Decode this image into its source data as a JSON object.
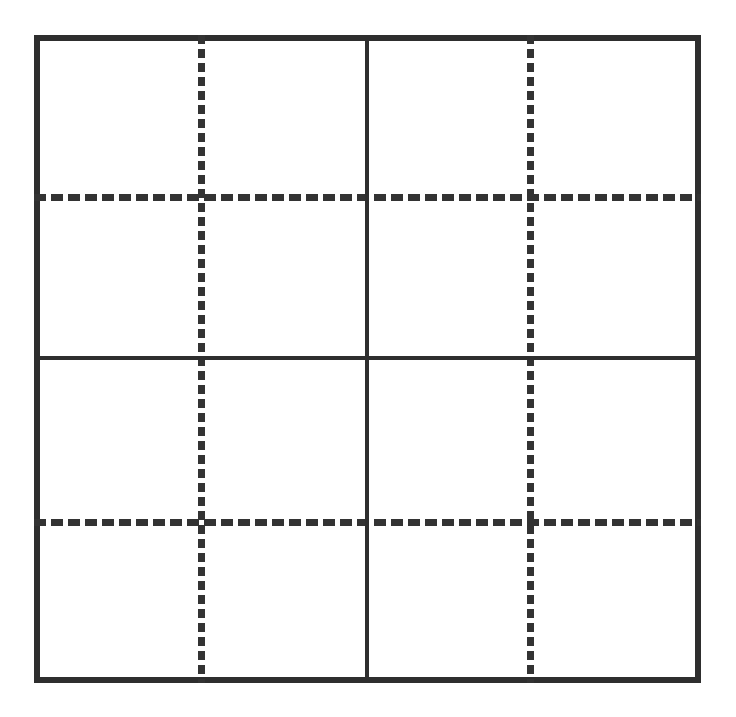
{
  "figure": {
    "background_color": "#ffffff",
    "canvas": {
      "width": 736,
      "height": 717
    }
  },
  "chart_data": {
    "type": "diagram",
    "shape": "square",
    "rows": 4,
    "columns": 4,
    "cell_count": 16,
    "grid": {
      "outer_border": {
        "name": "outer-square",
        "style": "solid",
        "color": "#2e2e2e",
        "thickness_px": 6,
        "left": 34,
        "top": 35,
        "right": 701,
        "bottom": 683,
        "width": 667,
        "height": 648
      },
      "vertical_lines": [
        {
          "name": "dashed-vertical-left",
          "style": "dashed",
          "color": "#333333",
          "x": 201,
          "thickness_px": 7,
          "dash_px": 9,
          "gap_px": 5,
          "spans_full_height": true
        },
        {
          "name": "solid-vertical-center",
          "style": "solid",
          "color": "#2e2e2e",
          "x": 367,
          "thickness_px": 4,
          "spans_full_height": true
        },
        {
          "name": "dashed-vertical-right",
          "style": "dashed",
          "color": "#333333",
          "x": 530,
          "thickness_px": 7,
          "dash_px": 9,
          "gap_px": 5,
          "spans_full_height": true
        }
      ],
      "horizontal_lines": [
        {
          "name": "dashed-horizontal-top",
          "style": "dashed",
          "color": "#333333",
          "y": 197,
          "thickness_px": 7,
          "dash_px": 12,
          "gap_px": 5,
          "spans_full_width": true
        },
        {
          "name": "solid-horizontal-center",
          "style": "solid",
          "color": "#2e2e2e",
          "y": 358,
          "thickness_px": 4,
          "spans_full_width": true
        },
        {
          "name": "dashed-horizontal-bottom",
          "style": "dashed",
          "color": "#333333",
          "y": 522,
          "thickness_px": 7,
          "dash_px": 12,
          "gap_px": 5,
          "spans_full_width": true
        }
      ]
    },
    "quadrants": [
      {
        "name": "top-left",
        "row": 1,
        "column": 1
      },
      {
        "name": "top-right",
        "row": 1,
        "column": 2
      },
      {
        "name": "bottom-left",
        "row": 2,
        "column": 1
      },
      {
        "name": "bottom-right",
        "row": 2,
        "column": 2
      }
    ],
    "cells": [
      {
        "row": 1,
        "column": 1,
        "label": ""
      },
      {
        "row": 1,
        "column": 2,
        "label": ""
      },
      {
        "row": 1,
        "column": 3,
        "label": ""
      },
      {
        "row": 1,
        "column": 4,
        "label": ""
      },
      {
        "row": 2,
        "column": 1,
        "label": ""
      },
      {
        "row": 2,
        "column": 2,
        "label": ""
      },
      {
        "row": 2,
        "column": 3,
        "label": ""
      },
      {
        "row": 2,
        "column": 4,
        "label": ""
      },
      {
        "row": 3,
        "column": 1,
        "label": ""
      },
      {
        "row": 3,
        "column": 2,
        "label": ""
      },
      {
        "row": 3,
        "column": 3,
        "label": ""
      },
      {
        "row": 3,
        "column": 4,
        "label": ""
      },
      {
        "row": 4,
        "column": 1,
        "label": ""
      },
      {
        "row": 4,
        "column": 2,
        "label": ""
      },
      {
        "row": 4,
        "column": 3,
        "label": ""
      },
      {
        "row": 4,
        "column": 4,
        "label": ""
      }
    ],
    "column_boundaries_px": [
      34,
      201,
      367,
      530,
      701
    ],
    "row_boundaries_px": [
      35,
      197,
      358,
      522,
      683
    ],
    "annotations": [],
    "legend": [],
    "grid_on": true
  }
}
